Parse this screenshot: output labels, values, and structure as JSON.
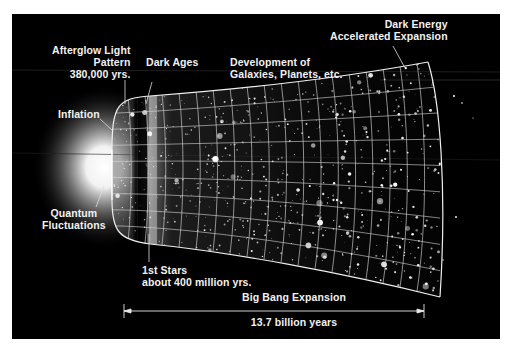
{
  "diagram": {
    "background_color": "#000000",
    "frame_color": "#ffffff",
    "labels": {
      "afterglow": {
        "line1": "Afterglow Light",
        "line2": "Pattern",
        "line3": "380,000 yrs."
      },
      "dark_ages": {
        "line1": "Dark Ages"
      },
      "development": {
        "line1": "Development of",
        "line2": "Galaxies, Planets, etc."
      },
      "dark_energy": {
        "line1": "Dark Energy",
        "line2": "Accelerated Expansion"
      },
      "inflation": {
        "line1": "Inflation"
      },
      "quantum": {
        "line1": "Quantum",
        "line2": "Fluctuations"
      },
      "first_stars": {
        "line1": "1st Stars",
        "line2": "about 400 million yrs."
      },
      "expansion": {
        "title": "Big Bang Expansion",
        "duration": "13.7 billion years"
      }
    },
    "stages": [
      "Quantum Fluctuations",
      "Inflation",
      "Afterglow Light Pattern 380,000 yrs.",
      "Dark Ages",
      "1st Stars about 400 million yrs.",
      "Development of Galaxies, Planets, etc.",
      "Dark Energy Accelerated Expansion"
    ]
  }
}
